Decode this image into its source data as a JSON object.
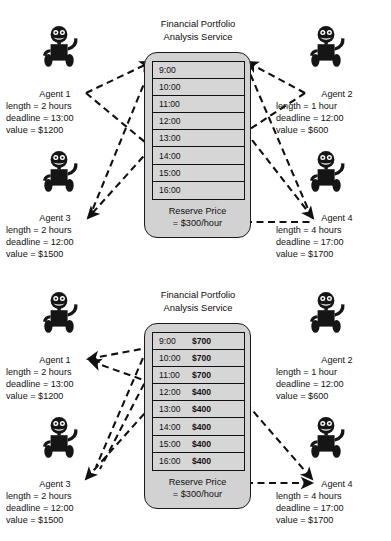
{
  "figure": {
    "panels": [
      {
        "id": "top",
        "service": {
          "title_line1": "Financial Portfolio",
          "title_line2": "Analysis Service",
          "reserve_line1": "Reserve Price",
          "reserve_line2": "= $300/hour",
          "show_prices": false,
          "slots": [
            {
              "time": "9:00",
              "price": ""
            },
            {
              "time": "10:00",
              "price": ""
            },
            {
              "time": "11:00",
              "price": ""
            },
            {
              "time": "12:00",
              "price": ""
            },
            {
              "time": "13:00",
              "price": ""
            },
            {
              "time": "14:00",
              "price": ""
            },
            {
              "time": "15:00",
              "price": ""
            },
            {
              "time": "16:00",
              "price": ""
            }
          ]
        },
        "agents": [
          {
            "name": "Agent 1",
            "length": "length = 2 hours",
            "deadline": "deadline = 13:00",
            "value": "value = $1200"
          },
          {
            "name": "Agent 2",
            "length": "length = 1 hour",
            "deadline": "deadline = 12:00",
            "value": "value = $600"
          },
          {
            "name": "Agent 3",
            "length": "length = 2 hours",
            "deadline": "deadline = 12:00",
            "value": "value = $1500"
          },
          {
            "name": "Agent 4",
            "length": "length = 4 hours",
            "deadline": "deadline = 17:00",
            "value": "value = $1700"
          }
        ]
      },
      {
        "id": "bottom",
        "service": {
          "title_line1": "Financial Portfolio",
          "title_line2": "Analysis Service",
          "reserve_line1": "Reserve Price",
          "reserve_line2": "= $300/hour",
          "show_prices": true,
          "slots": [
            {
              "time": "9:00",
              "price": "$700"
            },
            {
              "time": "10:00",
              "price": "$700"
            },
            {
              "time": "11:00",
              "price": "$700"
            },
            {
              "time": "12:00",
              "price": "$400"
            },
            {
              "time": "13:00",
              "price": "$400"
            },
            {
              "time": "14:00",
              "price": "$400"
            },
            {
              "time": "15:00",
              "price": "$400"
            },
            {
              "time": "16:00",
              "price": "$400"
            }
          ]
        },
        "agents": [
          {
            "name": "Agent 1",
            "length": "length = 2 hours",
            "deadline": "deadline = 13:00",
            "value": "value = $1200"
          },
          {
            "name": "Agent 2",
            "length": "length = 1 hour",
            "deadline": "deadline = 12:00",
            "value": "value = $600"
          },
          {
            "name": "Agent 3",
            "length": "length = 2 hours",
            "deadline": "deadline = 12:00",
            "value": "value = $1500"
          },
          {
            "name": "Agent 4",
            "length": "length = 4 hours",
            "deadline": "deadline = 17:00",
            "value": "value = $1700"
          }
        ]
      }
    ],
    "colors": {
      "ink": "#111111",
      "service_fill": "#d2d2d2",
      "slot_fill": "#d6d6d6",
      "background": "#ffffff"
    },
    "icons": {
      "robot": "robot-icon",
      "arrow": "dashed-arrow"
    }
  }
}
